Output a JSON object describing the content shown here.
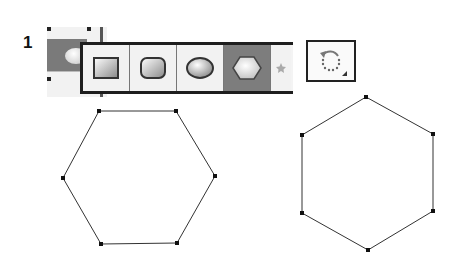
{
  "step": {
    "number": "1"
  },
  "toolbar": {
    "tools": [
      {
        "name": "rectangle-tool",
        "selected": false
      },
      {
        "name": "rounded-rectangle-tool",
        "selected": false
      },
      {
        "name": "ellipse-tool",
        "selected": false
      },
      {
        "name": "polygon-tool",
        "selected": true
      },
      {
        "name": "star-tool",
        "selected": false,
        "partial": true
      }
    ],
    "rotate_button": {
      "icon": "rotate-arrow-icon"
    }
  },
  "shapes": [
    {
      "name": "hexagon-flat-top",
      "points": [
        [
          99,
          111
        ],
        [
          176,
          111
        ],
        [
          215,
          176
        ],
        [
          177,
          243
        ],
        [
          101,
          244
        ],
        [
          63,
          178
        ]
      ]
    },
    {
      "name": "hexagon-pointy-top",
      "points": [
        [
          366,
          97
        ],
        [
          433,
          134
        ],
        [
          433,
          211
        ],
        [
          368,
          250
        ],
        [
          302,
          213
        ],
        [
          302,
          135
        ]
      ]
    }
  ],
  "colors": {
    "selected_tool_bg": "#7d7d7d",
    "tool_bg": "#f2f2f2",
    "stroke": "#222222"
  }
}
